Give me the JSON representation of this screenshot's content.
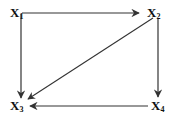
{
  "diagram": {
    "type": "directed-graph",
    "nodes": [
      {
        "id": "X1",
        "letter": "X",
        "subscript": "1"
      },
      {
        "id": "X2",
        "letter": "X",
        "subscript": "2"
      },
      {
        "id": "X3",
        "letter": "X",
        "subscript": "3"
      },
      {
        "id": "X4",
        "letter": "X",
        "subscript": "4"
      }
    ],
    "edges": [
      {
        "from": "X1",
        "to": "X2"
      },
      {
        "from": "X1",
        "to": "X3"
      },
      {
        "from": "X2",
        "to": "X3"
      },
      {
        "from": "X2",
        "to": "X4"
      },
      {
        "from": "X4",
        "to": "X3"
      }
    ],
    "colors": {
      "line": "#333333",
      "text": "#111111",
      "background": "#ffffff"
    }
  }
}
